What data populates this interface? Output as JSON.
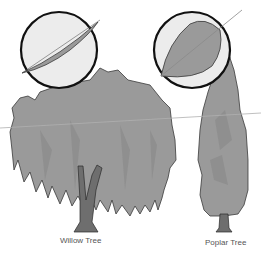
{
  "labels": {
    "willow": "Willow Tree",
    "poplar": "Poplar Tree"
  },
  "colors": {
    "background": "#ffffff",
    "foliage": "#9a9a9a",
    "foliage_dark": "#8a8a8a",
    "trunk": "#6e6e6e",
    "outline": "#2a2a2a",
    "magnifier_fill": "#ececec",
    "magnifier_ring": "#111111",
    "horizon_line": "#b0b0b0"
  },
  "illustrations": [
    {
      "name": "willow-tree",
      "leaf": "narrow lanceolate willow leaf"
    },
    {
      "name": "poplar-tree",
      "leaf": "broad ovate poplar leaf"
    }
  ]
}
